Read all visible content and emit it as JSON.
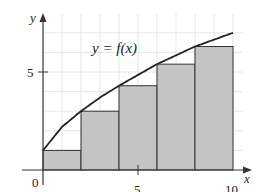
{
  "chart_data": {
    "type": "bar",
    "title": "",
    "xlabel": "x",
    "ylabel": "y",
    "curve_label": "y = f(x)",
    "x_ticks": [
      {
        "value": 0,
        "label": "0"
      },
      {
        "value": 5,
        "label": "5"
      },
      {
        "value": 10,
        "label": "10"
      }
    ],
    "y_ticks": [
      {
        "value": 5,
        "label": "5"
      }
    ],
    "xlim": [
      0,
      10.5
    ],
    "ylim": [
      0,
      7.5
    ],
    "grid": true,
    "bars": [
      {
        "x0": 0,
        "x1": 2,
        "height": 1.0
      },
      {
        "x0": 2,
        "x1": 4,
        "height": 3.0
      },
      {
        "x0": 4,
        "x1": 6,
        "height": 4.3
      },
      {
        "x0": 6,
        "x1": 8,
        "height": 5.4
      },
      {
        "x0": 8,
        "x1": 10,
        "height": 6.3
      }
    ],
    "curve": {
      "name": "f(x)",
      "points": [
        [
          0,
          1.0
        ],
        [
          1,
          2.2
        ],
        [
          2,
          3.0
        ],
        [
          3,
          3.7
        ],
        [
          4,
          4.3
        ],
        [
          5,
          4.85
        ],
        [
          6,
          5.4
        ],
        [
          7,
          5.85
        ],
        [
          8,
          6.3
        ],
        [
          9,
          6.65
        ],
        [
          10,
          7.0
        ]
      ]
    },
    "colors": {
      "bar_fill": "#c4c4c4",
      "bar_stroke": "#333333",
      "curve": "#222222",
      "grid": "#e6e6e6",
      "axis": "#333333"
    }
  }
}
